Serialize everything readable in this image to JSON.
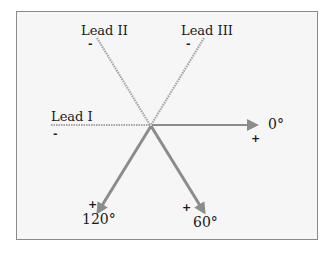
{
  "diagram": {
    "leads": [
      {
        "name": "Lead I",
        "negative_sign": "-"
      },
      {
        "name": "Lead II",
        "negative_sign": "-"
      },
      {
        "name": "Lead III",
        "negative_sign": "-"
      }
    ],
    "axes": [
      {
        "angle_label": "0°",
        "positive_sign": "+",
        "direction": "right"
      },
      {
        "angle_label": "60°",
        "positive_sign": "+",
        "direction": "down-right"
      },
      {
        "angle_label": "120°",
        "positive_sign": "+",
        "direction": "down-left"
      }
    ],
    "colors": {
      "background": "#f6f6f6",
      "border": "#8a8a8a",
      "positive_arrow": "#8c8c8c",
      "negative_hatched": "#a8a8a8",
      "text": "#1a1a1a"
    }
  }
}
